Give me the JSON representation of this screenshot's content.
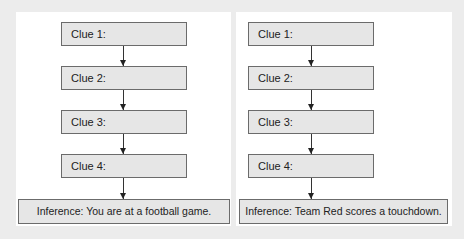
{
  "diagram": {
    "type": "flowchart",
    "panels": [
      {
        "clues": [
          {
            "label": "Clue 1:"
          },
          {
            "label": "Clue 2:"
          },
          {
            "label": "Clue 3:"
          },
          {
            "label": "Clue 4:"
          }
        ],
        "inference": "Inference: You are at a football game."
      },
      {
        "clues": [
          {
            "label": "Clue 1:"
          },
          {
            "label": "Clue 2:"
          },
          {
            "label": "Clue 3:"
          },
          {
            "label": "Clue 4:"
          }
        ],
        "inference": "Inference: Team Red scores a touchdown."
      }
    ]
  },
  "colors": {
    "background": "#ececec",
    "panel": "#ffffff",
    "box_fill": "#e6e6e6",
    "box_border": "#6b6b6b",
    "arrow": "#333333"
  }
}
